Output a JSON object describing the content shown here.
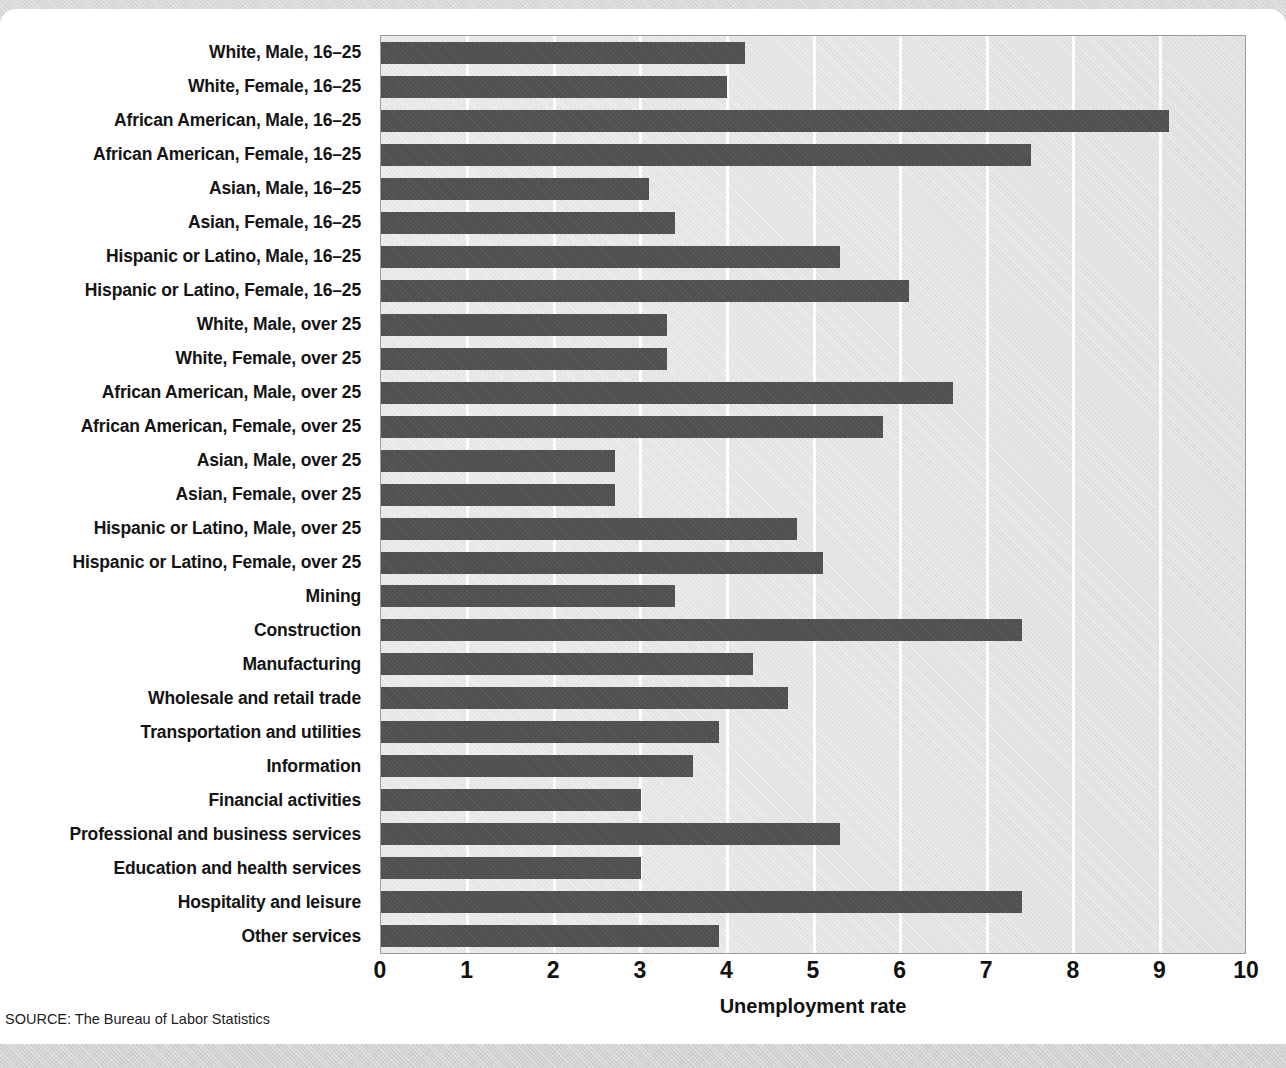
{
  "figure": {
    "cropped_title": "",
    "source": "SOURCE: The Bureau of Labor Statistics",
    "accent_bar_color": "#4f4f4f",
    "plot_background_color": "#e2e2e2",
    "gridline_color": "#fdfdfd"
  },
  "chart_data": {
    "type": "bar",
    "orientation": "horizontal",
    "title": "",
    "xlabel": "Unemployment rate",
    "ylabel": "",
    "xlim": [
      0,
      10
    ],
    "xticks": [
      "0",
      "1",
      "2",
      "3",
      "4",
      "5",
      "6",
      "7",
      "8",
      "9",
      "10"
    ],
    "grid": true,
    "legend": "none",
    "categories": [
      "White, Male, 16–25",
      "White, Female, 16–25",
      "African American, Male, 16–25",
      "African American, Female, 16–25",
      "Asian, Male, 16–25",
      "Asian, Female, 16–25",
      "Hispanic or Latino, Male, 16–25",
      "Hispanic or Latino, Female, 16–25",
      "White, Male, over 25",
      "White, Female, over 25",
      "African American, Male, over 25",
      "African American, Female, over 25",
      "Asian, Male, over 25",
      "Asian, Female, over 25",
      "Hispanic or Latino, Male, over 25",
      "Hispanic or Latino, Female, over 25",
      "Mining",
      "Construction",
      "Manufacturing",
      "Wholesale and retail trade",
      "Transportation and utilities",
      "Information",
      "Financial activities",
      "Professional and business services",
      "Education and health services",
      "Hospitality and leisure",
      "Other services"
    ],
    "values": [
      4.2,
      4.0,
      9.1,
      7.5,
      3.1,
      3.4,
      5.3,
      6.1,
      3.3,
      3.3,
      6.6,
      5.8,
      2.7,
      2.7,
      4.8,
      5.1,
      3.4,
      7.4,
      4.3,
      4.7,
      3.9,
      3.6,
      3.0,
      5.3,
      3.0,
      7.4,
      3.9
    ]
  }
}
